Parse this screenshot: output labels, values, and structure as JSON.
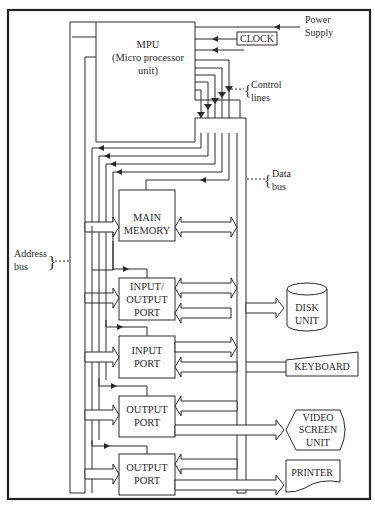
{
  "diagram": {
    "blocks": {
      "mpu": {
        "line1": "MPU",
        "line2": "(Micro processor",
        "line3": "unit)"
      },
      "clock": "CLOCK",
      "main_memory": {
        "line1": "MAIN",
        "line2": "MEMORY"
      },
      "io_port": {
        "line1": "INPUT/",
        "line2": "OUTPUT",
        "line3": "PORT"
      },
      "input_port": {
        "line1": "INPUT",
        "line2": "PORT"
      },
      "output_port_1": {
        "line1": "OUTPUT",
        "line2": "PORT"
      },
      "output_port_2": {
        "line1": "OUTPUT",
        "line2": "PORT"
      }
    },
    "peripherals": {
      "disk": {
        "line1": "DISK",
        "line2": "UNIT"
      },
      "keyboard": "KEYBOARD",
      "video": {
        "line1": "VIDEO",
        "line2": "SCREEN",
        "line3": "UNIT"
      },
      "printer": "PRINTER"
    },
    "annotations": {
      "power_supply": {
        "line1": "Power",
        "line2": "Supply"
      },
      "control_lines": {
        "line1": "Control",
        "line2": "lines"
      },
      "data_bus": {
        "line1": "Data",
        "line2": "bus"
      },
      "address_bus": {
        "line1": "Address",
        "line2": "bus"
      }
    }
  }
}
